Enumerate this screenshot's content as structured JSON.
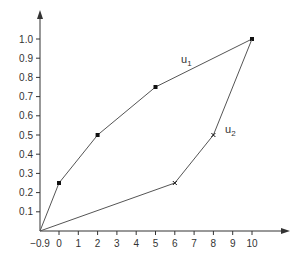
{
  "chart_data": {
    "type": "line",
    "title": "",
    "xlabel": "",
    "ylabel": "",
    "xlim": [
      -0.9,
      11.5
    ],
    "ylim": [
      0,
      1.1
    ],
    "grid": false,
    "x_ticks": [
      "-0.9",
      "0",
      "1",
      "2",
      "3",
      "4",
      "5",
      "6",
      "7",
      "8",
      "9",
      "10"
    ],
    "x_tick_values": [
      -0.9,
      0,
      1,
      2,
      3,
      4,
      5,
      6,
      7,
      8,
      9,
      10
    ],
    "y_ticks": [
      "0.1",
      "0.2",
      "0.3",
      "0.4",
      "0.5",
      "0.6",
      "0.7",
      "0.8",
      "0.9",
      "1.0"
    ],
    "y_tick_values": [
      0.1,
      0.2,
      0.3,
      0.4,
      0.5,
      0.6,
      0.7,
      0.8,
      0.9,
      1.0
    ],
    "series": [
      {
        "name": "u1",
        "label_main": "u",
        "label_sub": "1",
        "x": [
          -0.9,
          0,
          2,
          5,
          10
        ],
        "y": [
          0,
          0.25,
          0.5,
          0.75,
          1.0
        ],
        "marker": "dot"
      },
      {
        "name": "u2",
        "label_main": "u",
        "label_sub": "2",
        "x": [
          -0.9,
          6,
          8,
          10
        ],
        "y": [
          0,
          0.25,
          0.5,
          1.0
        ],
        "marker": "cross"
      }
    ],
    "colors": {
      "axis": "#333333",
      "line": "#555555",
      "marker": "#111111"
    }
  }
}
